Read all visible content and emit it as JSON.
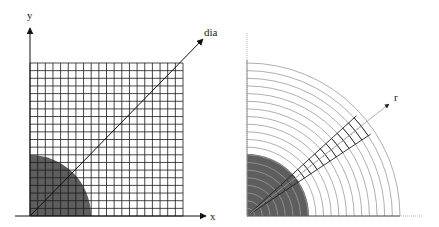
{
  "left_panel": {
    "title": "Cartesian grid",
    "axis_x_label": "x",
    "axis_y_label": "y",
    "diagonal_label": "dia",
    "grid_cells": 20,
    "shaded_region": "quarter disk",
    "colors": {
      "grid": "#1a1a1a",
      "shade": "#5e5e5e",
      "axis": "#111111"
    }
  },
  "right_panel": {
    "title": "Polar grid",
    "radial_label": "r",
    "arc_count": 20,
    "wedge_cells": 20,
    "shaded_region": "quarter disk",
    "colors": {
      "arcs": "#9a9a9a",
      "wedge": "#222222",
      "shade": "#5e5e5e",
      "axis": "#888888"
    }
  }
}
